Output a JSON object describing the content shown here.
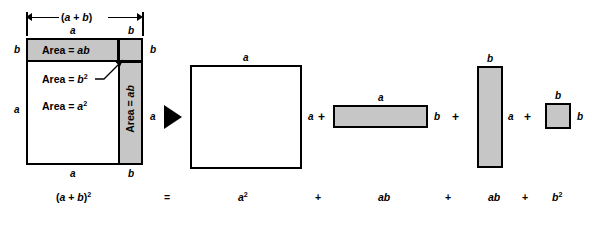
{
  "figure": {
    "colors": {
      "shaded_fill": "#c6c6c6",
      "unshaded_fill": "#ffffff",
      "stroke": "#000000",
      "background": "#ffffff"
    }
  },
  "left_diagram": {
    "top_dimension_label": "(a + b)",
    "top_segment_labels": {
      "left": "a",
      "right": "b"
    },
    "left_segment_labels": {
      "top": "b",
      "bottom": "a"
    },
    "right_segment_labels": {
      "top": "b",
      "bottom": "a"
    },
    "bottom_segment_labels": {
      "left": "a",
      "right": "b"
    },
    "regions": [
      {
        "name": "top-band",
        "label": "Area = ab",
        "shaded": true
      },
      {
        "name": "corner-square",
        "label": "Area = b²",
        "shaded": true,
        "callout": true
      },
      {
        "name": "main-square",
        "label": "Area = a²",
        "shaded": false
      },
      {
        "name": "right-column",
        "label": "Area = ab",
        "shaded": true,
        "rotated": true
      }
    ]
  },
  "operator_arrow": {
    "name": "equals-arrow",
    "glyph": "➤"
  },
  "right_diagram": {
    "shapes": [
      {
        "name": "a-squared-square",
        "shaded": false,
        "top_label": "a",
        "right_label": "a"
      },
      {
        "name": "ab-horizontal-rect",
        "shaded": true,
        "top_label": "a",
        "right_label": "b"
      },
      {
        "name": "ab-vertical-rect",
        "shaded": true,
        "top_label": "b",
        "right_label": "a"
      },
      {
        "name": "b-squared-square",
        "shaded": true,
        "top_label": "b",
        "right_label": "b"
      }
    ],
    "plus_signs": [
      "+",
      "+",
      "+"
    ]
  },
  "equation": {
    "terms": [
      {
        "name": "left-hand-side",
        "text": "(a + b)²"
      },
      {
        "name": "equals-sign",
        "text": "="
      },
      {
        "name": "term-a-squared",
        "text": "a²"
      },
      {
        "name": "plus-1",
        "text": "+"
      },
      {
        "name": "term-ab-1",
        "text": "ab"
      },
      {
        "name": "plus-2",
        "text": "+"
      },
      {
        "name": "term-ab-2",
        "text": "ab"
      },
      {
        "name": "plus-3",
        "text": "+"
      },
      {
        "name": "term-b-squared",
        "text": "b²"
      }
    ]
  }
}
